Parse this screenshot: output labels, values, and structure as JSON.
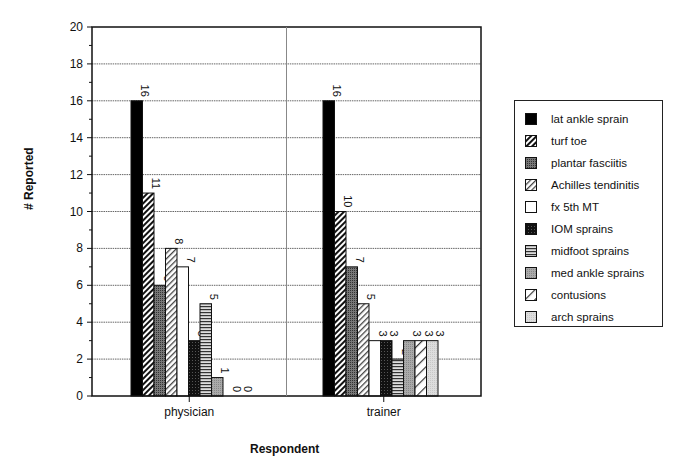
{
  "chart_data": {
    "type": "bar",
    "title": "",
    "xlabel": "Respondent",
    "ylabel": "#  Reported",
    "ylim": [
      0,
      20
    ],
    "yticks": [
      0,
      2,
      4,
      6,
      8,
      10,
      12,
      14,
      16,
      18,
      20
    ],
    "grid": true,
    "legend_position": "right",
    "categories": [
      "physician",
      "trainer"
    ],
    "series": [
      {
        "name": "lat ankle sprain",
        "values": [
          16,
          16
        ],
        "pattern": "solid-black"
      },
      {
        "name": "turf toe",
        "values": [
          11,
          10
        ],
        "pattern": "dense-diagonal-dark"
      },
      {
        "name": "plantar fasciitis",
        "values": [
          6,
          7
        ],
        "pattern": "crosshatch-gray"
      },
      {
        "name": "Achilles tendinitis",
        "values": [
          8,
          5
        ],
        "pattern": "diagonal-light"
      },
      {
        "name": "fx 5th MT",
        "values": [
          7,
          3
        ],
        "pattern": "white"
      },
      {
        "name": "IOM sprains",
        "values": [
          3,
          3
        ],
        "pattern": "dark-stipple"
      },
      {
        "name": "midfoot sprains",
        "values": [
          5,
          2
        ],
        "pattern": "horizontal-lines"
      },
      {
        "name": "med ankle sprains",
        "values": [
          1,
          3
        ],
        "pattern": "medium-gray"
      },
      {
        "name": "contusions",
        "values": [
          0,
          3
        ],
        "pattern": "wide-diagonal"
      },
      {
        "name": "arch sprains",
        "values": [
          0,
          3
        ],
        "pattern": "light-gray"
      }
    ]
  },
  "axis": {
    "x_title": "Respondent",
    "y_title": "#  Reported"
  }
}
